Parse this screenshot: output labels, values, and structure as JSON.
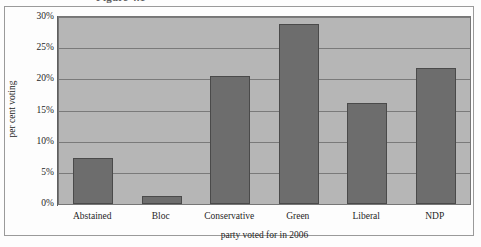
{
  "figure": {
    "caption": "Figure 4.1",
    "caption_visible_note": "cropped at top edge"
  },
  "chart_data": {
    "type": "bar",
    "title": "",
    "categories": [
      "Abstained",
      "Bloc",
      "Conservative",
      "Green",
      "Liberal",
      "NDP"
    ],
    "values": [
      7.4,
      1.3,
      20.5,
      28.8,
      16.2,
      21.8
    ],
    "xlabel": "party voted for in 2006",
    "ylabel": "per cent voting",
    "ylim": [
      0,
      30
    ],
    "ytick_values": [
      0,
      5,
      10,
      15,
      20,
      25,
      30
    ],
    "ytick_labels": [
      "0%",
      "5%",
      "10%",
      "15%",
      "20%",
      "25%",
      "30%"
    ],
    "grid": true,
    "legend": false,
    "bar_color": "#6d6d6d",
    "plot_background": "#b6b6b6",
    "gridline_color": "#7a7a7a"
  }
}
